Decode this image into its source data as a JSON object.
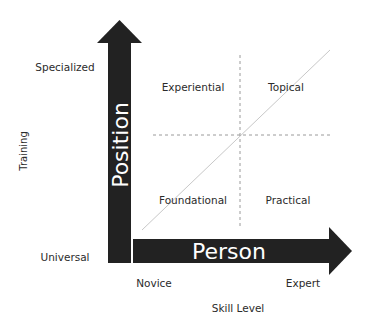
{
  "diagram": {
    "vertical_arrow": {
      "label": "Position",
      "color": "#222222"
    },
    "horizontal_arrow": {
      "label": "Person",
      "color": "#222222"
    },
    "y_axis": {
      "title": "Training",
      "top_label": "Specialized",
      "bottom_label": "Universal"
    },
    "x_axis": {
      "title": "Skill Level",
      "left_label": "Novice",
      "right_label": "Expert"
    },
    "quadrants": {
      "top_left": "Experiential",
      "top_right": "Topical",
      "bottom_left": "Foundational",
      "bottom_right": "Practical"
    },
    "guides": {
      "dashed_color": "#999999",
      "diagonal_color": "#c8c8c8"
    }
  }
}
